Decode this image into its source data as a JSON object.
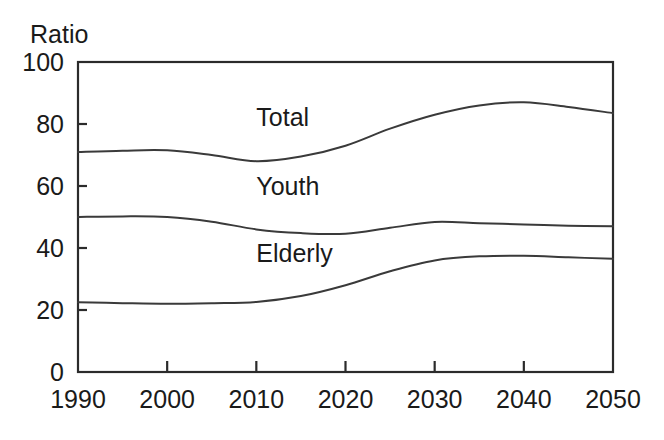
{
  "chart_data": {
    "type": "line",
    "title": "",
    "ylabel": "Ratio",
    "xlabel": "",
    "xlim": [
      1990,
      2050
    ],
    "ylim": [
      0,
      100
    ],
    "grid": false,
    "legend_position": "inline-labels",
    "yticks": [
      "0",
      "20",
      "40",
      "60",
      "80",
      "100"
    ],
    "ytick_values": [
      0,
      20,
      40,
      60,
      80,
      100
    ],
    "xticks": [
      "1990",
      "2000",
      "2010",
      "2020",
      "2030",
      "2040",
      "2050"
    ],
    "xtick_values": [
      1990,
      2000,
      2010,
      2020,
      2030,
      2040,
      2050
    ],
    "x": [
      1990,
      1995,
      2000,
      2005,
      2010,
      2015,
      2020,
      2025,
      2030,
      2035,
      2040,
      2045,
      2050
    ],
    "series": [
      {
        "name": "Total",
        "label": "Total",
        "color": "#3a3a3a",
        "values": [
          71.0,
          71.4,
          71.5,
          70.0,
          68.0,
          69.5,
          73.0,
          78.5,
          83.0,
          86.0,
          87.0,
          85.5,
          83.5
        ]
      },
      {
        "name": "Youth",
        "label": "Youth",
        "color": "#3a3a3a",
        "values": [
          50.0,
          50.2,
          50.0,
          48.5,
          46.0,
          44.8,
          44.6,
          46.5,
          48.4,
          48.0,
          47.6,
          47.2,
          47.0
        ]
      },
      {
        "name": "Elderly",
        "label": "Elderly",
        "color": "#3a3a3a",
        "values": [
          22.5,
          22.2,
          22.0,
          22.2,
          22.6,
          24.5,
          28.0,
          32.5,
          36.0,
          37.3,
          37.5,
          37.0,
          36.5
        ]
      }
    ],
    "annotations": [
      {
        "text": "Total",
        "x": 2010.0,
        "y": 79.5
      },
      {
        "text": "Youth",
        "x": 2010.0,
        "y": 57.0
      },
      {
        "text": "Elderly",
        "x": 2010.0,
        "y": 35.5
      }
    ]
  },
  "axes": {
    "ylabel": "Ratio"
  }
}
